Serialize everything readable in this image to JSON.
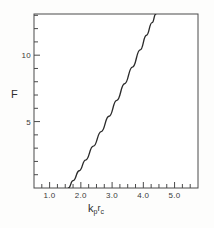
{
  "figure": {
    "background_color": "#fdfdfc",
    "frame_color": "#4a4a4a",
    "curve_color": "#2b2b2b"
  },
  "axes": {
    "y_title": "F",
    "x_title_base1": "k",
    "x_title_sub1": "p",
    "x_title_base2": "r",
    "x_title_sub2": "c",
    "x_tick_labels": [
      "1.0",
      "2.0",
      "3.0",
      "4.0",
      "5.0"
    ],
    "y_tick_labels": [
      "5",
      "10"
    ]
  },
  "chart_data": {
    "type": "line",
    "title": "",
    "subtitle": "",
    "xlabel": "k_p r_c",
    "ylabel": "F",
    "xlim": [
      0.5,
      5.75
    ],
    "ylim": [
      0,
      13.1
    ],
    "grid": false,
    "legend": null,
    "x_major_ticks": [
      1.0,
      2.0,
      3.0,
      4.0,
      5.0
    ],
    "x_minor_tick_step": 0.25,
    "y_major_ticks": [
      5,
      10
    ],
    "y_minor_tick_step": 1,
    "series": [
      {
        "name": "F vs k_p r_c",
        "x": [
          1.6,
          1.75,
          1.95,
          2.15,
          2.4,
          2.65,
          2.9,
          3.15,
          3.4,
          3.65,
          3.9,
          4.1,
          4.28,
          4.4
        ],
        "y": [
          0.0,
          0.55,
          1.3,
          2.1,
          3.15,
          4.25,
          5.4,
          6.6,
          7.85,
          9.1,
          10.4,
          11.5,
          12.45,
          13.1
        ]
      }
    ],
    "annotations": []
  }
}
